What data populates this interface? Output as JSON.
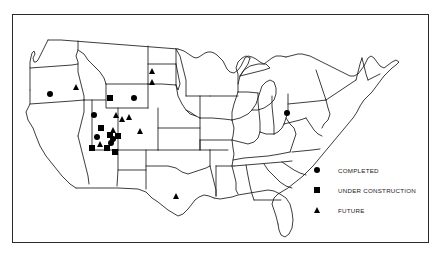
{
  "figure": {
    "type": "map",
    "region": "Contiguous United States",
    "title": "",
    "frame": {
      "border_color": "#2b2b2b",
      "background": "#ffffff"
    },
    "outline_color": "#1a1a1a",
    "marker_color": "#000000"
  },
  "legend": {
    "position": "bottom-right",
    "items": [
      {
        "symbol": "circle",
        "label": "COMPLETED",
        "icon": "filled-circle-icon"
      },
      {
        "symbol": "square",
        "label": "UNDER CONSTRUCTION",
        "icon": "filled-square-icon"
      },
      {
        "symbol": "triangle",
        "label": "FUTURE",
        "icon": "filled-triangle-icon"
      }
    ]
  },
  "markers": [
    {
      "symbol": "circle",
      "state": "Oregon",
      "x": 50,
      "y": 94
    },
    {
      "symbol": "triangle",
      "state": "Idaho",
      "x": 77,
      "y": 87
    },
    {
      "symbol": "triangle",
      "state": "North Dakota",
      "x": 153,
      "y": 71
    },
    {
      "symbol": "triangle",
      "state": "South Dakota",
      "x": 153,
      "y": 82
    },
    {
      "symbol": "square",
      "state": "Wyoming",
      "x": 110,
      "y": 98
    },
    {
      "symbol": "circle",
      "state": "Wyoming",
      "x": 134,
      "y": 98
    },
    {
      "symbol": "circle",
      "state": "Utah",
      "x": 94,
      "y": 115
    },
    {
      "symbol": "triangle",
      "state": "Colorado",
      "x": 117,
      "y": 115
    },
    {
      "symbol": "triangle",
      "state": "Colorado",
      "x": 123,
      "y": 119
    },
    {
      "symbol": "triangle",
      "state": "Colorado",
      "x": 130,
      "y": 117
    },
    {
      "symbol": "square",
      "state": "Utah",
      "x": 101,
      "y": 128
    },
    {
      "symbol": "triangle",
      "state": "Colorado",
      "x": 114,
      "y": 130
    },
    {
      "symbol": "triangle",
      "state": "Colorado",
      "x": 141,
      "y": 131
    },
    {
      "symbol": "circle",
      "state": "Utah",
      "x": 97,
      "y": 137
    },
    {
      "symbol": "square",
      "state": "Colorado",
      "x": 110,
      "y": 135
    },
    {
      "symbol": "circle",
      "state": "Colorado",
      "x": 113,
      "y": 139
    },
    {
      "symbol": "square",
      "state": "Colorado",
      "x": 118,
      "y": 136
    },
    {
      "symbol": "triangle",
      "state": "Utah",
      "x": 101,
      "y": 144
    },
    {
      "symbol": "circle",
      "state": "Colorado",
      "x": 111,
      "y": 143
    },
    {
      "symbol": "square",
      "state": "Arizona",
      "x": 92,
      "y": 148
    },
    {
      "symbol": "square",
      "state": "New Mexico",
      "x": 107,
      "y": 148
    },
    {
      "symbol": "square",
      "state": "New Mexico",
      "x": 115,
      "y": 152
    },
    {
      "symbol": "triangle",
      "state": "Texas",
      "x": 177,
      "y": 196
    },
    {
      "symbol": "circle",
      "state": "Pennsylvania",
      "x": 287,
      "y": 113
    }
  ]
}
